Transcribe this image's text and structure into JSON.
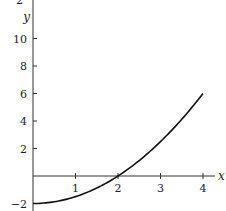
{
  "chart_data": {
    "type": "line",
    "title": "",
    "xlabel": "x",
    "ylabel": "y",
    "xlim": [
      0,
      4.3
    ],
    "ylim": [
      -2.3,
      12.5
    ],
    "grid": false,
    "legend": null,
    "x_ticks": [
      1,
      2,
      3,
      4
    ],
    "x_tick_labels": [
      "1",
      "2",
      "3",
      "4"
    ],
    "y_ticks": [
      -2,
      2,
      4,
      6,
      8,
      10
    ],
    "y_tick_labels": [
      "−2",
      "2",
      "4",
      "6",
      "8",
      "10"
    ],
    "top_cut_label": "2",
    "series": [
      {
        "name": "y = x²/2 − 2",
        "x": [
          0,
          0.5,
          1,
          1.5,
          2,
          2.5,
          3,
          3.5,
          4
        ],
        "values": [
          -2,
          -1.875,
          -1.5,
          -0.875,
          0,
          1.125,
          2.5,
          4.125,
          6
        ]
      }
    ],
    "annotations": []
  },
  "colors": {
    "axis": "#333333",
    "curve": "#111111",
    "text": "#222222",
    "background": "#ffffff"
  }
}
